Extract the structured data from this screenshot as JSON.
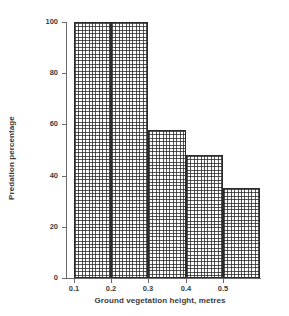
{
  "chart_data": {
    "type": "bar",
    "title": "",
    "xlabel": "Ground vegetation height, metres",
    "ylabel": "Predation percentage",
    "categories": [
      "0.1-0.2",
      "0.2-0.3",
      "0.3-0.4",
      "0.4-0.5",
      "0.5-0.6"
    ],
    "bin_edges": [
      0.1,
      0.2,
      0.3,
      0.4,
      0.5,
      0.6
    ],
    "values": [
      100,
      100,
      58,
      48,
      35
    ],
    "xlim": [
      0.1,
      0.6
    ],
    "ylim": [
      0,
      100
    ],
    "x_ticks": [
      "0.1",
      "0.2",
      "0.3",
      "0.4",
      "0.5"
    ],
    "x_tick_values": [
      0.1,
      0.2,
      0.3,
      0.4,
      0.5
    ],
    "y_ticks": [
      "0",
      "20",
      "40",
      "60",
      "80",
      "100"
    ],
    "y_tick_values": [
      0,
      20,
      40,
      60,
      80,
      100
    ],
    "grid": false,
    "legend": "none",
    "bar_fill": "crosshatch-grid",
    "bar_edge_color": "#2b2b2b",
    "background_color": "#ffffff",
    "axis_color": "#6b6b6b",
    "text_color": "#3c3c3c"
  }
}
